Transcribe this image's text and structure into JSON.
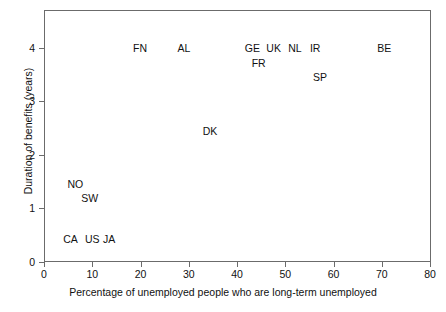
{
  "chart_data": {
    "type": "scatter",
    "title": "",
    "xlabel": "Percentage of unemployed people who are long-term unemployed",
    "ylabel": "Duration of benefits (years)",
    "xlim": [
      0,
      80
    ],
    "ylim": [
      0,
      4.7
    ],
    "xticks": [
      0,
      10,
      20,
      30,
      40,
      50,
      60,
      70,
      80
    ],
    "xticklabels": [
      "0",
      "10",
      "20",
      "30",
      "40",
      "50",
      "60",
      "70",
      "80"
    ],
    "yticks": [
      0,
      1,
      2,
      3,
      4
    ],
    "yticklabels": [
      "0",
      "1",
      "2",
      "3",
      "4"
    ],
    "grid": false,
    "legend": null,
    "marker_style": "text-label",
    "points": [
      {
        "label": "NO",
        "x": 6.5,
        "y": 1.45
      },
      {
        "label": "SW",
        "x": 9.5,
        "y": 1.2
      },
      {
        "label": "CA",
        "x": 5.5,
        "y": 0.43
      },
      {
        "label": "US",
        "x": 10.0,
        "y": 0.43
      },
      {
        "label": "JA",
        "x": 13.5,
        "y": 0.43
      },
      {
        "label": "FN",
        "x": 19.9,
        "y": 4.0
      },
      {
        "label": "AL",
        "x": 29.0,
        "y": 4.0
      },
      {
        "label": "DK",
        "x": 34.4,
        "y": 2.45
      },
      {
        "label": "GE",
        "x": 43.2,
        "y": 4.0
      },
      {
        "label": "FR",
        "x": 44.5,
        "y": 3.72
      },
      {
        "label": "UK",
        "x": 47.6,
        "y": 4.0
      },
      {
        "label": "NL",
        "x": 52.0,
        "y": 4.0
      },
      {
        "label": "IR",
        "x": 56.2,
        "y": 4.0
      },
      {
        "label": "SP",
        "x": 57.2,
        "y": 3.45
      },
      {
        "label": "BE",
        "x": 70.5,
        "y": 4.0
      }
    ]
  },
  "axis": {
    "frame_color": "#6b6b6b",
    "text_color": "#111111",
    "background": "#ffffff"
  }
}
